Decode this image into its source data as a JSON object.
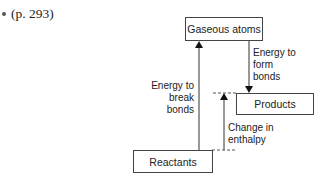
{
  "bullet": {
    "text": "(p. 293)"
  },
  "diagram": {
    "boxes": {
      "gaseous_atoms": "Gaseous atoms",
      "products": "Products",
      "reactants": "Reactants"
    },
    "labels": {
      "break_bonds": [
        "Energy to",
        "break",
        "bonds"
      ],
      "form_bonds": [
        "Energy to",
        "form",
        "bonds"
      ],
      "enthalpy": [
        "Change in",
        "enthalpy"
      ]
    },
    "colors": {
      "line": "#333333",
      "dash": "#555555",
      "text": "#222222"
    }
  }
}
